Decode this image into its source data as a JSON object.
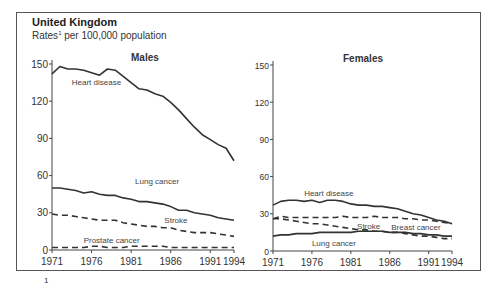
{
  "header": {
    "title": "United Kingdom",
    "subtitle_prefix": "Rates",
    "subtitle_sup": "1",
    "subtitle_suffix": " per 100,000 population"
  },
  "footnote": {
    "marker": "1"
  },
  "chart_data": [
    {
      "type": "line",
      "title": "Males",
      "xlabel": "",
      "ylabel": "Rates per 100,000 population",
      "x_ticks": [
        1971,
        1976,
        1981,
        1986,
        1991,
        1994
      ],
      "y_ticks": [
        0,
        30,
        60,
        90,
        120,
        150
      ],
      "ylim": [
        0,
        150
      ],
      "xlim": [
        1971,
        1994
      ],
      "grid": false,
      "x": [
        1971,
        1972,
        1973,
        1974,
        1975,
        1976,
        1977,
        1978,
        1979,
        1980,
        1981,
        1982,
        1983,
        1984,
        1985,
        1986,
        1987,
        1988,
        1989,
        1990,
        1991,
        1992,
        1993,
        1994
      ],
      "series": [
        {
          "name": "Heart disease",
          "style": "solid",
          "label_pos": [
            1973.5,
            133
          ],
          "values": [
            142,
            148,
            146,
            146,
            145,
            143,
            141,
            146,
            145,
            140,
            135,
            130,
            129,
            126,
            124,
            119,
            113,
            106,
            99,
            93,
            89,
            85,
            82,
            72
          ]
        },
        {
          "name": "Lung cancer",
          "style": "solid",
          "label_pos": [
            1981.5,
            53
          ],
          "values": [
            50,
            50,
            49,
            48,
            46,
            47,
            45,
            44,
            44,
            42,
            41,
            39,
            39,
            38,
            37,
            35,
            32,
            32,
            30,
            29,
            28,
            26,
            25,
            24
          ]
        },
        {
          "name": "Stroke",
          "style": "dashed",
          "label_pos": [
            1985.2,
            22
          ],
          "values": [
            29,
            28,
            28,
            27,
            26,
            25,
            24,
            24,
            24,
            22,
            21,
            20,
            19,
            19,
            18,
            18,
            16,
            15,
            14,
            14,
            14,
            13,
            12,
            11
          ]
        },
        {
          "name": "Prostate cancer",
          "style": "dashed",
          "label_pos": [
            1975,
            6
          ],
          "values": [
            2,
            2,
            2,
            2,
            2,
            3,
            3,
            2,
            2,
            2,
            3,
            3,
            3,
            3,
            3,
            2,
            2,
            2,
            2,
            2,
            2,
            2,
            2,
            2
          ]
        }
      ]
    },
    {
      "type": "line",
      "title": "Females",
      "xlabel": "",
      "ylabel": "Rates per 100,000 population",
      "x_ticks": [
        1971,
        1976,
        1981,
        1986,
        1991,
        1994
      ],
      "y_ticks": [
        0,
        30,
        60,
        90,
        120,
        150
      ],
      "ylim": [
        0,
        150
      ],
      "xlim": [
        1971,
        1994
      ],
      "grid": false,
      "x": [
        1971,
        1972,
        1973,
        1974,
        1975,
        1976,
        1977,
        1978,
        1979,
        1980,
        1981,
        1982,
        1983,
        1984,
        1985,
        1986,
        1987,
        1988,
        1989,
        1990,
        1991,
        1992,
        1993,
        1994
      ],
      "series": [
        {
          "name": "Heart disease",
          "style": "solid",
          "label_pos": [
            1975,
            44
          ],
          "values": [
            37,
            40,
            41,
            41,
            40,
            41,
            39,
            41,
            41,
            40,
            38,
            37,
            37,
            36,
            36,
            35,
            34,
            32,
            30,
            29,
            27,
            25,
            24,
            22
          ]
        },
        {
          "name": "Stroke",
          "style": "dashed",
          "label_pos": [
            1981.8,
            18
          ],
          "values": [
            26,
            26,
            25,
            24,
            23,
            22,
            22,
            21,
            20,
            19,
            18,
            17,
            17,
            16,
            16,
            15,
            15,
            14,
            13,
            12,
            12,
            11,
            10,
            10
          ]
        },
        {
          "name": "Breast cancer",
          "style": "dashed",
          "label_pos": [
            1986.2,
            17
          ],
          "values": [
            26,
            28,
            27,
            27,
            27,
            27,
            27,
            27,
            27,
            28,
            27,
            27,
            27,
            28,
            27,
            27,
            27,
            26,
            26,
            25,
            25,
            24,
            23,
            22
          ]
        },
        {
          "name": "Lung cancer",
          "style": "solid",
          "label_pos": [
            1976,
            4
          ],
          "values": [
            12,
            13,
            13,
            14,
            14,
            14,
            15,
            15,
            15,
            15,
            15,
            16,
            16,
            16,
            16,
            15,
            15,
            15,
            14,
            14,
            13,
            13,
            12,
            12
          ]
        }
      ]
    }
  ]
}
